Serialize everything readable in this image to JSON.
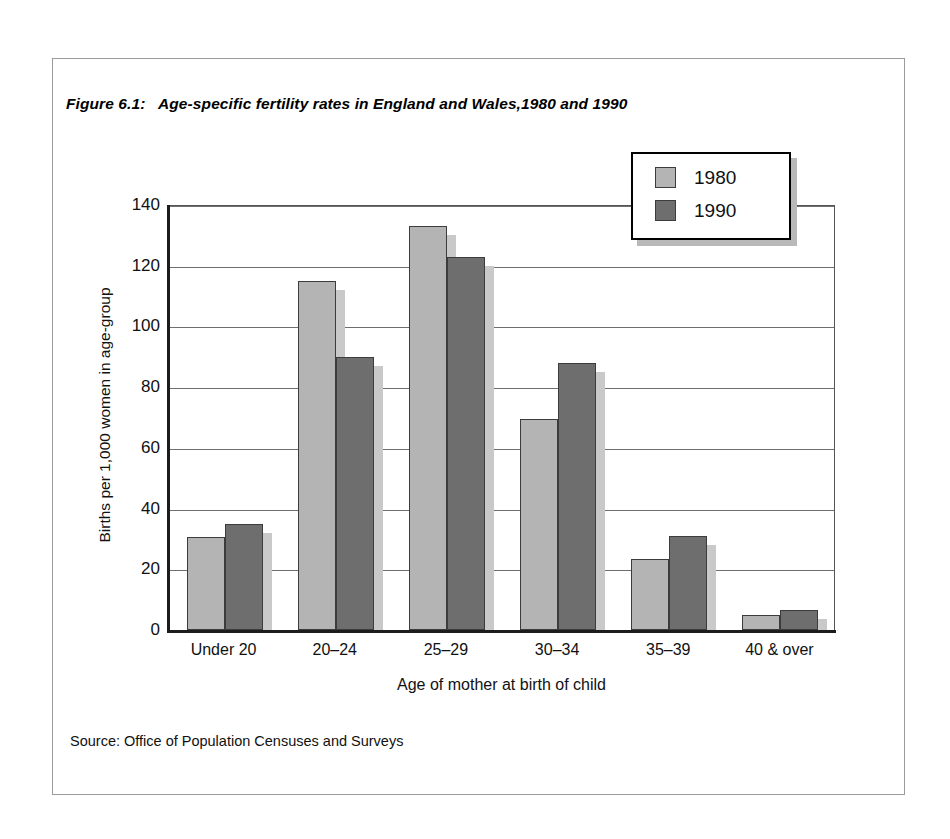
{
  "figure": {
    "number_label": "Figure 6.1:",
    "title": "Age-specific fertility rates in England and Wales,1980 and 1990",
    "source": "Source: Office of Population Censuses and Surveys"
  },
  "legend": {
    "position": "top-right-inside",
    "entries": [
      {
        "label": "1980",
        "color": "#b4b4b4"
      },
      {
        "label": "1990",
        "color": "#6e6e6e"
      }
    ]
  },
  "chart_data": {
    "type": "bar",
    "title": "Age-specific fertility rates in England and Wales,1980 and 1990",
    "xlabel": "Age of mother at birth of child",
    "ylabel": "Births per 1,000 women in age-group",
    "categories": [
      "Under 20",
      "20–24",
      "25–29",
      "30–34",
      "35–39",
      "40 & over"
    ],
    "series": [
      {
        "name": "1980",
        "color": "#b4b4b4",
        "values": [
          30.5,
          115,
          133,
          69.5,
          23.5,
          5
        ]
      },
      {
        "name": "1990",
        "color": "#6e6e6e",
        "values": [
          35,
          90,
          123,
          88,
          31,
          6.5
        ]
      }
    ],
    "ylim": [
      0,
      140
    ],
    "yticks": [
      0,
      20,
      40,
      60,
      80,
      100,
      120,
      140
    ],
    "ytick_labels": [
      "0",
      "20",
      "40",
      "60",
      "80",
      "100",
      "120",
      "140"
    ],
    "grid": "horizontal",
    "legend": "top-right",
    "source": "Office of Population Censuses and Surveys"
  }
}
